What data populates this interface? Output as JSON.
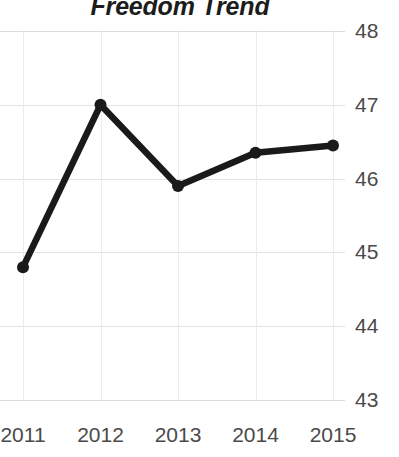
{
  "chart_data": {
    "type": "line",
    "title": "Freedom Trend",
    "xlabel": "",
    "ylabel": "",
    "categories": [
      "2011",
      "2012",
      "2013",
      "2014",
      "2015"
    ],
    "x": [
      2011,
      2012,
      2013,
      2014,
      2015
    ],
    "values": [
      44.8,
      47.0,
      45.9,
      46.35,
      46.45
    ],
    "series": [
      {
        "name": "Freedom Trend",
        "values": [
          44.8,
          47.0,
          45.9,
          46.35,
          46.45
        ]
      }
    ],
    "ylim": [
      43,
      48
    ],
    "yticks": [
      "43",
      "44",
      "45",
      "46",
      "47",
      "48"
    ],
    "xticks": [
      "2011",
      "2012",
      "2013",
      "2014",
      "2015"
    ],
    "grid": true,
    "legend": false,
    "y_axis_position": "right",
    "line_color": "#1a1a1a",
    "marker_color": "#1a1a1a",
    "grid_color": "#e3e3e3",
    "tick_label_color": "#4a4a4a",
    "title_color": "#1c1c1c",
    "background_color": "#ffffff"
  }
}
